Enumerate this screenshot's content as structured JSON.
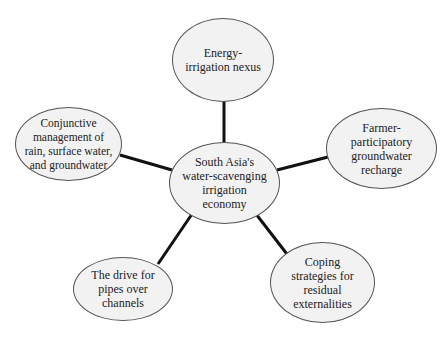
{
  "diagram": {
    "center": {
      "label": "South Asia's\nwater-scavenging\nirrigation\neconomy"
    },
    "nodes": [
      {
        "id": "top",
        "label": "Energy-\nirrigation nexus"
      },
      {
        "id": "right",
        "label": "Farmer-\nparticipatory\ngroundwater\nrecharge"
      },
      {
        "id": "bottom-right",
        "label": "Coping\nstrategies for\nresidual\nexternalities"
      },
      {
        "id": "bottom-left",
        "label": "The drive for\npipes over\nchannels"
      },
      {
        "id": "left",
        "label": "Conjunctive\nmanagement of\nrain, surface water,\nand groundwater"
      }
    ],
    "colors": {
      "node_fill": "#f2f2f2",
      "node_border": "#555555",
      "link": "#111111"
    }
  }
}
